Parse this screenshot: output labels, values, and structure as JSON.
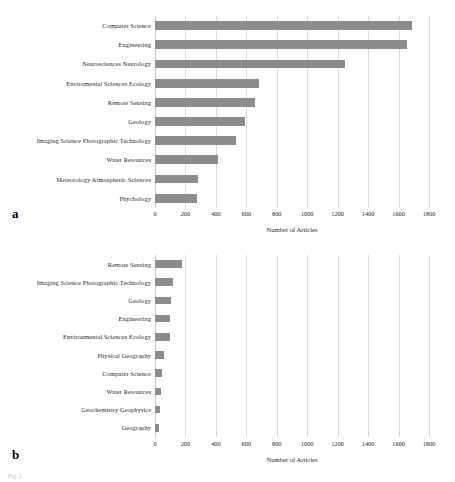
{
  "figure": {
    "caption_partial": "Fig. 1",
    "bar_color": "#8c8c8c",
    "grid_color": "#d9d9d9"
  },
  "panels": {
    "a": {
      "letter": "a",
      "xlabel": "Number of Articles",
      "ticks": [
        "0",
        "200",
        "400",
        "600",
        "800",
        "1000",
        "1200",
        "1400",
        "1600",
        "1800"
      ]
    },
    "b": {
      "letter": "b",
      "xlabel": "Number of Articles",
      "ticks": [
        "0",
        "200",
        "400",
        "600",
        "800",
        "1000",
        "1200",
        "1400",
        "1600",
        "1800"
      ]
    }
  },
  "chart_data": [
    {
      "type": "bar",
      "orientation": "horizontal",
      "panel": "a",
      "title": "",
      "xlabel": "Number of Articles",
      "ylabel": "",
      "xlim": [
        0,
        1800
      ],
      "xticks": [
        0,
        200,
        400,
        600,
        800,
        1000,
        1200,
        1400,
        1600,
        1800
      ],
      "grid": true,
      "legend": "none",
      "categories": [
        "Computer Science",
        "Engineering",
        "Neurosciences Neurology",
        "Enviromental Sciences Ecology",
        "Remote Sensing",
        "Geology",
        "Imaging Science Photographic Technology",
        "Water Resources",
        "Meteorology Atmospheric Sciences",
        "Phychology"
      ],
      "values": [
        1690,
        1655,
        1250,
        680,
        660,
        590,
        535,
        415,
        285,
        275
      ]
    },
    {
      "type": "bar",
      "orientation": "horizontal",
      "panel": "b",
      "title": "",
      "xlabel": "Number of Articles",
      "ylabel": "",
      "xlim": [
        0,
        1800
      ],
      "xticks": [
        0,
        200,
        400,
        600,
        800,
        1000,
        1200,
        1400,
        1600,
        1800
      ],
      "grid": true,
      "legend": "none",
      "categories": [
        "Remote Sensing",
        "Imaging Science Photographic Technology",
        "Geology",
        "Engineering",
        "Environmental Sciences Ecology",
        "Physical Geography",
        "Computer Science",
        "Water Resources",
        "Geochemistry Geophysics",
        "Geography"
      ],
      "values": [
        180,
        118,
        102,
        100,
        98,
        58,
        45,
        38,
        30,
        24
      ]
    }
  ]
}
